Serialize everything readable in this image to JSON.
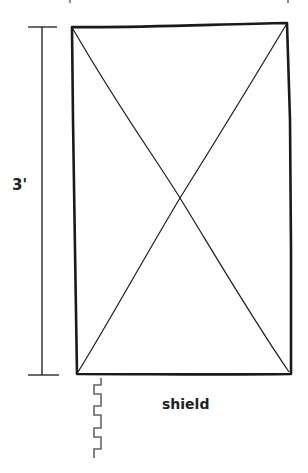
{
  "diagram": {
    "dimension_label": "3'",
    "object_label": "shield",
    "colors": {
      "stroke": "#1a1a1a",
      "edge_profile": "#666666",
      "background": "#ffffff"
    }
  }
}
